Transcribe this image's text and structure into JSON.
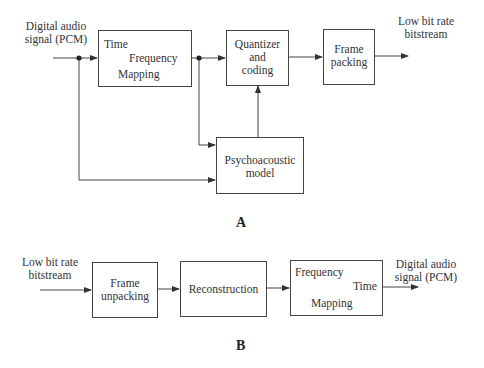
{
  "diagram_a": {
    "caption": "A",
    "input_label": [
      "Digital audio",
      "signal (PCM)"
    ],
    "output_label": [
      "Low bit rate",
      "bitstream"
    ],
    "blocks": {
      "tf_mapping": {
        "top_left": "Time",
        "top_right": "Frequency",
        "bottom": "Mapping"
      },
      "quantizer": {
        "lines": [
          "Quantizer",
          "and",
          "coding"
        ]
      },
      "frame_packing": {
        "lines": [
          "Frame",
          "packing"
        ]
      },
      "psychoacoustic": {
        "lines": [
          "Psychoacoustic",
          "model"
        ]
      }
    }
  },
  "diagram_b": {
    "caption": "B",
    "input_label": [
      "Low bit rate",
      "bitstream"
    ],
    "output_label": [
      "Digital audio",
      "signal (PCM)"
    ],
    "blocks": {
      "frame_unpacking": {
        "lines": [
          "Frame",
          "unpacking"
        ]
      },
      "reconstruction": {
        "lines": [
          "Reconstruction"
        ]
      },
      "ft_mapping": {
        "top_left": "Frequency",
        "top_right": "Time",
        "bottom": "Mapping"
      }
    }
  }
}
